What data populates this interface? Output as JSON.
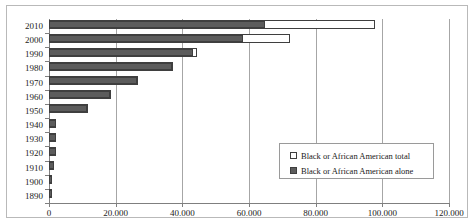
{
  "chart_data": {
    "type": "bar",
    "orientation": "horizontal",
    "title": "",
    "subtitle": "",
    "xlabel": "",
    "ylabel": "",
    "xlim": [
      0,
      120000
    ],
    "ylim": null,
    "grid": true,
    "grid_axis": "x",
    "legend_position": "inside-bottom-right",
    "categories": [
      "2010",
      "2000",
      "1990",
      "1980",
      "1970",
      "1960",
      "1950",
      "1940",
      "1930",
      "1920",
      "1910",
      "1900",
      "1890"
    ],
    "xtick_labels": [
      "0",
      "20.000",
      "40.000",
      "60.000",
      "80.000",
      "100.000",
      "120.000"
    ],
    "xtick_values": [
      0,
      20000,
      40000,
      60000,
      80000,
      100000,
      120000
    ],
    "series": [
      {
        "name": "Black or African American total",
        "color": "#ffffff",
        "edge_color": "#3f3f3f",
        "values": [
          97800,
          72300,
          44400,
          37300,
          26600,
          18600,
          11600,
          2200,
          2100,
          2200,
          1600,
          1000,
          1000
        ]
      },
      {
        "name": "Black or African American alone",
        "color": "#5c5c5c",
        "edge_color": "#3f3f3f",
        "values": [
          64800,
          58200,
          43200,
          36900,
          26400,
          18300,
          11400,
          2100,
          2000,
          2100,
          1500,
          900,
          900
        ]
      }
    ]
  },
  "legend": {
    "items": [
      {
        "label": "Black or African American total",
        "marker": "hollow-square"
      },
      {
        "label": "Black or African American alone",
        "marker": "filled-square"
      }
    ]
  },
  "colors": {
    "bar_alone": "#5c5c5c",
    "bar_total": "#ffffff",
    "bar_edge": "#3f3f3f",
    "gridline": "#a6a6a6",
    "axis": "#7f7f7f",
    "frame": "#b9b9b9",
    "text": "#222222"
  }
}
